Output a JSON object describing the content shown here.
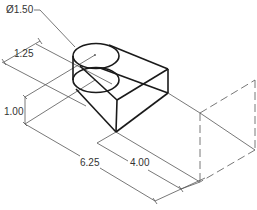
{
  "drawing": {
    "title": "Isometric dimensioned part",
    "colors": {
      "object_line": "#1a1a1a",
      "dimension_line": "#555555",
      "hidden_line": "#555555",
      "background": "#ffffff"
    },
    "dimensions": {
      "diameter": "Ø1.50",
      "hole_offset": "1.25",
      "height": "1.00",
      "total_length": "6.25",
      "partial_length": "4.00"
    }
  }
}
